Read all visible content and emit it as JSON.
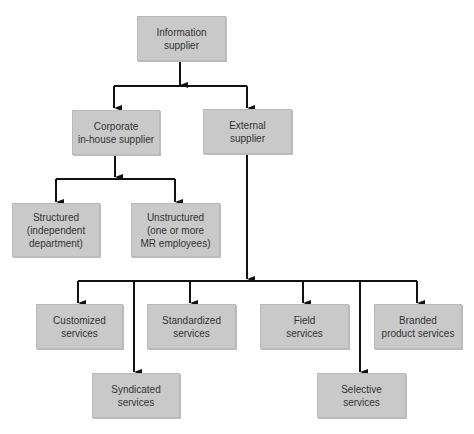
{
  "diagram": {
    "type": "hierarchy",
    "nodes": {
      "root": {
        "label": "Information\nsupplier"
      },
      "corporate": {
        "label": "Corporate\nin-house supplier"
      },
      "external": {
        "label": "External\nsupplier"
      },
      "structured": {
        "label": "Structured\n(independent\ndepartment)"
      },
      "unstructured": {
        "label": "Unstructured\n(one or more\nMR employees)"
      },
      "customized": {
        "label": "Customized\nservices"
      },
      "standardized": {
        "label": "Standardized\nservices"
      },
      "field": {
        "label": "Field\nservices"
      },
      "branded": {
        "label": "Branded\nproduct services"
      },
      "syndicated": {
        "label": "Syndicated\nservices"
      },
      "selective": {
        "label": "Selective\nservices"
      }
    },
    "edges": [
      {
        "from": "Information supplier",
        "to": "Corporate in-house supplier"
      },
      {
        "from": "Information supplier",
        "to": "External supplier"
      },
      {
        "from": "Corporate in-house supplier",
        "to": "Structured (independent department)"
      },
      {
        "from": "Corporate in-house supplier",
        "to": "Unstructured (one or more MR employees)"
      },
      {
        "from": "External supplier",
        "to": "Customized services"
      },
      {
        "from": "External supplier",
        "to": "Syndicated services"
      },
      {
        "from": "External supplier",
        "to": "Standardized services"
      },
      {
        "from": "External supplier",
        "to": "Field services"
      },
      {
        "from": "External supplier",
        "to": "Selective services"
      },
      {
        "from": "External supplier",
        "to": "Branded product services"
      }
    ],
    "colors": {
      "box_fill": "#c9c9c9",
      "box_text": "#333333",
      "connector": "#111111"
    }
  }
}
